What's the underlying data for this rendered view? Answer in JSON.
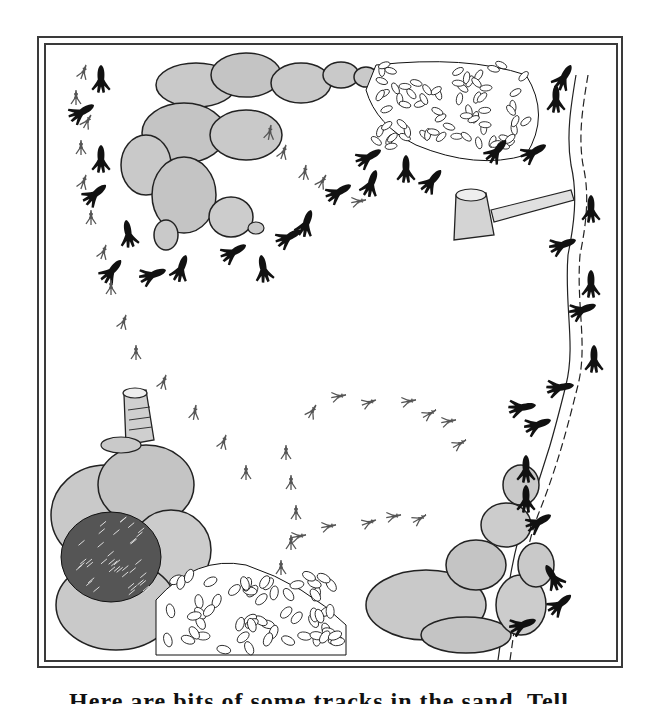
{
  "illustration": {
    "subject": "animal tracks around rocks, bushes, tree stumps and a stream",
    "palette": {
      "ink": "#111111",
      "rock_fill": "#c9c9c9",
      "rock_dark": "#b0b0b0",
      "paper": "#ffffff",
      "frame": "#3a3a3a"
    },
    "elements": {
      "rock_pile_top": "rock pile (top-left)",
      "rock_pile_bottom_left": "rock pile (bottom-left)",
      "rock_pile_bottom_right": "rock pile (bottom-right)",
      "bush_top": "leafy bush (top)",
      "bush_dark": "dark fern bush",
      "bush_light": "leafy bush (bottom)",
      "stump_center": "tree stump",
      "stump_left": "tree stump (left)",
      "log": "fallen log",
      "stream": "stream"
    }
  },
  "caption": {
    "text": "Here are bits of some tracks in the sand. Tell..."
  }
}
